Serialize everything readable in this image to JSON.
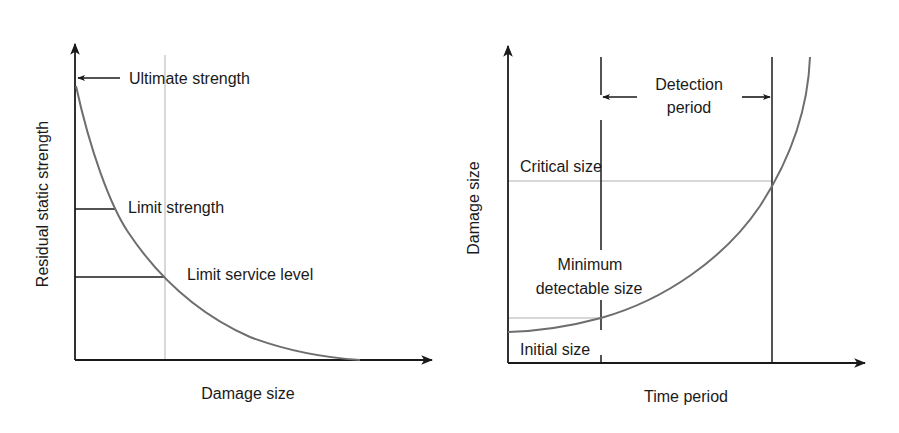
{
  "colors": {
    "axis": "#1a1a1a",
    "curve": "#6e6e6e",
    "guide": "#b0b0b0",
    "text": "#1a1a1a",
    "background": "#ffffff"
  },
  "left_diagram": {
    "y_axis_label": "Residual static strength",
    "x_axis_label": "Damage size",
    "annotations": {
      "ultimate": "Ultimate strength",
      "limit_strength": "Limit strength",
      "limit_service": "Limit service level"
    }
  },
  "right_diagram": {
    "y_axis_label": "Damage size",
    "x_axis_label": "Time period",
    "annotations": {
      "detection_line1": "Detection",
      "detection_line2": "period",
      "critical": "Critical size",
      "min_line1": "Minimum",
      "min_line2": "detectable size",
      "initial": "Initial size"
    }
  }
}
